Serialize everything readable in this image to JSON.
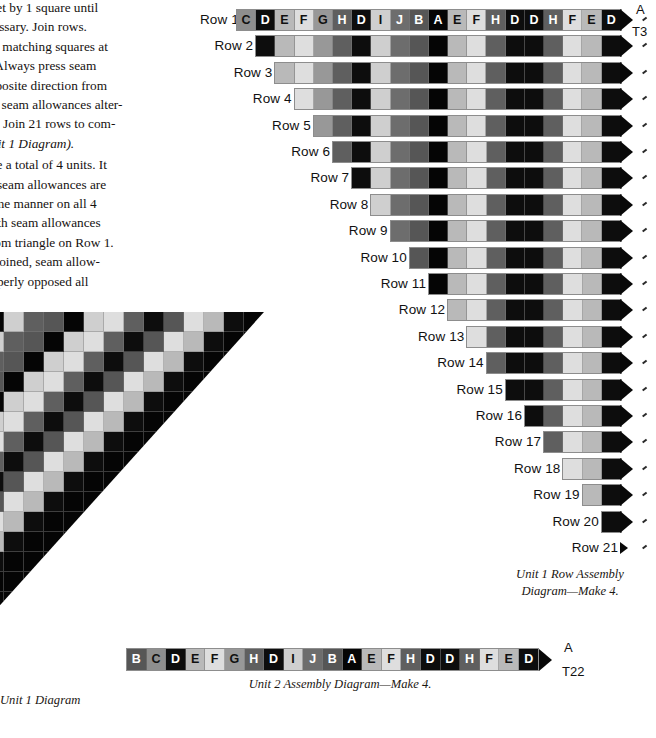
{
  "palette": {
    "A": "#050505",
    "B": "#565656",
    "C": "#8e8e8e",
    "D": "#0d0d0d",
    "E": "#b9b9b9",
    "F": "#dedede",
    "G": "#989898",
    "H": "#5f5f5f",
    "I": "#cfcfcf",
    "J": "#6d6d6d",
    "arrow": "#080808",
    "strip_border": "#8d8d8d",
    "text": "#15110f"
  },
  "body_text": {
    "paragraphs": [
      "ch offset by 1 square until",
      " if necessary. Join rows.",
      "ch row, matching squares at",
      "f unit. Always press seam",
      "s in opposite direction from",
      "row, so seam allowances alter-",
      "by row. Join 21 rows to com-",
      "t 1 (Unit 1 Diagram)."
    ],
    "paragraphs2": [
      "to make a total of 4 units. It",
      "nt that seam allowances are",
      " the same manner on all 4",
      "ting with seam allowances",
      "way from triangle on Row 1.",
      "its are joined, seam allow-",
      " be properly opposed all"
    ],
    "italic_tail": "(Unit 1 Diagram)."
  },
  "row_diagram": {
    "label_prefix": "Row",
    "letters_full": [
      "C",
      "D",
      "E",
      "F",
      "G",
      "H",
      "D",
      "I",
      "J",
      "B",
      "A",
      "E",
      "F",
      "H",
      "D",
      "D",
      "H",
      "F",
      "E",
      "D"
    ],
    "rows": [
      {
        "n": 1,
        "label": "Row 1",
        "squares": [
          "C",
          "D",
          "E",
          "F",
          "G",
          "H",
          "D",
          "I",
          "J",
          "B",
          "A",
          "E",
          "F",
          "H",
          "D",
          "D",
          "H",
          "F",
          "E",
          "D"
        ],
        "show_letters": true
      },
      {
        "n": 2,
        "label": "Row 2",
        "squares": [
          "D",
          "E",
          "F",
          "G",
          "H",
          "D",
          "I",
          "J",
          "B",
          "A",
          "E",
          "F",
          "H",
          "D",
          "D",
          "H",
          "F",
          "E",
          "D"
        ],
        "show_letters": false
      },
      {
        "n": 3,
        "label": "Row 3",
        "squares": [
          "E",
          "F",
          "G",
          "H",
          "D",
          "I",
          "J",
          "B",
          "A",
          "E",
          "F",
          "H",
          "D",
          "D",
          "H",
          "F",
          "E",
          "D"
        ],
        "show_letters": false
      },
      {
        "n": 4,
        "label": "Row 4",
        "squares": [
          "F",
          "G",
          "H",
          "D",
          "I",
          "J",
          "B",
          "A",
          "E",
          "F",
          "H",
          "D",
          "D",
          "H",
          "F",
          "E",
          "D"
        ],
        "show_letters": false
      },
      {
        "n": 5,
        "label": "Row 5",
        "squares": [
          "G",
          "H",
          "D",
          "I",
          "J",
          "B",
          "A",
          "E",
          "F",
          "H",
          "D",
          "D",
          "H",
          "F",
          "E",
          "D"
        ],
        "show_letters": false
      },
      {
        "n": 6,
        "label": "Row 6",
        "squares": [
          "H",
          "D",
          "I",
          "J",
          "B",
          "A",
          "E",
          "F",
          "H",
          "D",
          "D",
          "H",
          "F",
          "E",
          "D"
        ],
        "show_letters": false
      },
      {
        "n": 7,
        "label": "Row 7",
        "squares": [
          "D",
          "I",
          "J",
          "B",
          "A",
          "E",
          "F",
          "H",
          "D",
          "D",
          "H",
          "F",
          "E",
          "D"
        ],
        "show_letters": false
      },
      {
        "n": 8,
        "label": "Row 8",
        "squares": [
          "I",
          "J",
          "B",
          "A",
          "E",
          "F",
          "H",
          "D",
          "D",
          "H",
          "F",
          "E",
          "D"
        ],
        "show_letters": false
      },
      {
        "n": 9,
        "label": "Row 9",
        "squares": [
          "J",
          "B",
          "A",
          "E",
          "F",
          "H",
          "D",
          "D",
          "H",
          "F",
          "E",
          "D"
        ],
        "show_letters": false
      },
      {
        "n": 10,
        "label": "Row 10",
        "squares": [
          "B",
          "A",
          "E",
          "F",
          "H",
          "D",
          "D",
          "H",
          "F",
          "E",
          "D"
        ],
        "show_letters": false
      },
      {
        "n": 11,
        "label": "Row 11",
        "squares": [
          "A",
          "E",
          "F",
          "H",
          "D",
          "D",
          "H",
          "F",
          "E",
          "D"
        ],
        "show_letters": false
      },
      {
        "n": 12,
        "label": "Row 12",
        "squares": [
          "E",
          "F",
          "H",
          "D",
          "D",
          "H",
          "F",
          "E",
          "D"
        ],
        "show_letters": false
      },
      {
        "n": 13,
        "label": "Row 13",
        "squares": [
          "F",
          "H",
          "D",
          "D",
          "H",
          "F",
          "E",
          "D"
        ],
        "show_letters": false
      },
      {
        "n": 14,
        "label": "Row 14",
        "squares": [
          "H",
          "D",
          "D",
          "H",
          "F",
          "E",
          "D"
        ],
        "show_letters": false
      },
      {
        "n": 15,
        "label": "Row 15",
        "squares": [
          "D",
          "D",
          "H",
          "F",
          "E",
          "D"
        ],
        "show_letters": false
      },
      {
        "n": 16,
        "label": "Row 16",
        "squares": [
          "D",
          "H",
          "F",
          "E",
          "D"
        ],
        "show_letters": false
      },
      {
        "n": 17,
        "label": "Row 17",
        "squares": [
          "H",
          "F",
          "E",
          "D"
        ],
        "show_letters": false
      },
      {
        "n": 18,
        "label": "Row 18",
        "squares": [
          "F",
          "E",
          "D"
        ],
        "show_letters": false
      },
      {
        "n": 19,
        "label": "Row 19",
        "squares": [
          "E",
          "D"
        ],
        "show_letters": false
      },
      {
        "n": 20,
        "label": "Row 20",
        "squares": [
          "D"
        ],
        "show_letters": false
      },
      {
        "n": 21,
        "label": "Row 21",
        "squares": [],
        "show_letters": false
      }
    ],
    "callout_top": "A",
    "callout_top_sub": "T3",
    "caption_line1": "Unit 1 Row Assembly",
    "caption_line2": "Diagram—Make 4."
  },
  "unit2_diagram": {
    "squares": [
      "B",
      "C",
      "D",
      "E",
      "F",
      "G",
      "H",
      "D",
      "I",
      "J",
      "B",
      "A",
      "E",
      "F",
      "H",
      "D",
      "D",
      "H",
      "F",
      "E",
      "D"
    ],
    "callout": "A",
    "callout_sub": "T22",
    "caption": "Unit 2 Assembly Diagram—Make 4."
  },
  "unit1_block": {
    "caption": "Unit 1 Diagram",
    "grid_rows": 20,
    "grid_cols": 18,
    "shades": [
      [
        "H",
        "F",
        "G",
        "B",
        "A",
        "I",
        "H",
        "B",
        "A",
        "I",
        "F",
        "H",
        "D",
        "B",
        "F",
        "E",
        "D",
        "A"
      ],
      [
        "F",
        "G",
        "B",
        "A",
        "I",
        "H",
        "B",
        "A",
        "I",
        "F",
        "H",
        "D",
        "B",
        "F",
        "E",
        "D",
        "A",
        "A"
      ],
      [
        "G",
        "B",
        "A",
        "I",
        "H",
        "B",
        "A",
        "I",
        "F",
        "H",
        "D",
        "B",
        "F",
        "E",
        "D",
        "A",
        "A",
        "A"
      ],
      [
        "B",
        "A",
        "I",
        "H",
        "B",
        "A",
        "I",
        "F",
        "H",
        "D",
        "B",
        "F",
        "E",
        "D",
        "A",
        "A",
        "A",
        "A"
      ],
      [
        "A",
        "I",
        "H",
        "B",
        "A",
        "I",
        "F",
        "H",
        "D",
        "B",
        "F",
        "E",
        "D",
        "A",
        "A",
        "A",
        "A",
        "A"
      ],
      [
        "I",
        "H",
        "B",
        "A",
        "I",
        "F",
        "H",
        "D",
        "B",
        "F",
        "E",
        "D",
        "A",
        "A",
        "A",
        "A",
        "A",
        "A"
      ],
      [
        "H",
        "B",
        "A",
        "I",
        "F",
        "H",
        "D",
        "B",
        "F",
        "E",
        "D",
        "A",
        "A",
        "A",
        "A",
        "A",
        "A",
        "A"
      ],
      [
        "B",
        "A",
        "I",
        "F",
        "H",
        "D",
        "B",
        "F",
        "E",
        "D",
        "A",
        "A",
        "A",
        "A",
        "A",
        "A",
        "A",
        "A"
      ],
      [
        "A",
        "I",
        "F",
        "H",
        "D",
        "B",
        "F",
        "E",
        "D",
        "A",
        "A",
        "A",
        "A",
        "A",
        "A",
        "A",
        "A",
        "A"
      ],
      [
        "I",
        "F",
        "H",
        "D",
        "B",
        "F",
        "E",
        "D",
        "A",
        "A",
        "A",
        "A",
        "A",
        "A",
        "A",
        "A",
        "A",
        "A"
      ],
      [
        "F",
        "H",
        "D",
        "B",
        "F",
        "E",
        "D",
        "A",
        "A",
        "A",
        "A",
        "A",
        "A",
        "A",
        "A",
        "A",
        "A",
        "A"
      ],
      [
        "H",
        "D",
        "B",
        "F",
        "E",
        "D",
        "A",
        "A",
        "A",
        "A",
        "A",
        "A",
        "A",
        "A",
        "A",
        "A",
        "A",
        "A"
      ],
      [
        "D",
        "B",
        "F",
        "E",
        "D",
        "A",
        "A",
        "A",
        "A",
        "A",
        "A",
        "A",
        "A",
        "A",
        "A",
        "A",
        "A",
        "A"
      ],
      [
        "B",
        "F",
        "E",
        "D",
        "A",
        "A",
        "A",
        "A",
        "A",
        "A",
        "A",
        "A",
        "A",
        "A",
        "A",
        "A",
        "A",
        "A"
      ],
      [
        "F",
        "E",
        "D",
        "A",
        "A",
        "A",
        "A",
        "A",
        "A",
        "A",
        "A",
        "A",
        "A",
        "A",
        "A",
        "A",
        "A",
        "A"
      ],
      [
        "E",
        "D",
        "A",
        "A",
        "A",
        "A",
        "A",
        "A",
        "A",
        "A",
        "A",
        "A",
        "A",
        "A",
        "A",
        "A",
        "A",
        "A"
      ],
      [
        "D",
        "A",
        "A",
        "A",
        "A",
        "A",
        "A",
        "A",
        "A",
        "A",
        "A",
        "A",
        "A",
        "A",
        "A",
        "A",
        "A",
        "A"
      ],
      [
        "A",
        "A",
        "A",
        "A",
        "A",
        "A",
        "A",
        "A",
        "A",
        "A",
        "A",
        "A",
        "A",
        "A",
        "A",
        "A",
        "A",
        "A"
      ],
      [
        "A",
        "A",
        "A",
        "A",
        "A",
        "A",
        "A",
        "A",
        "A",
        "A",
        "A",
        "A",
        "A",
        "A",
        "A",
        "A",
        "A",
        "A"
      ],
      [
        "A",
        "A",
        "A",
        "A",
        "A",
        "A",
        "A",
        "A",
        "A",
        "A",
        "A",
        "A",
        "A",
        "A",
        "A",
        "A",
        "A",
        "A"
      ]
    ]
  }
}
